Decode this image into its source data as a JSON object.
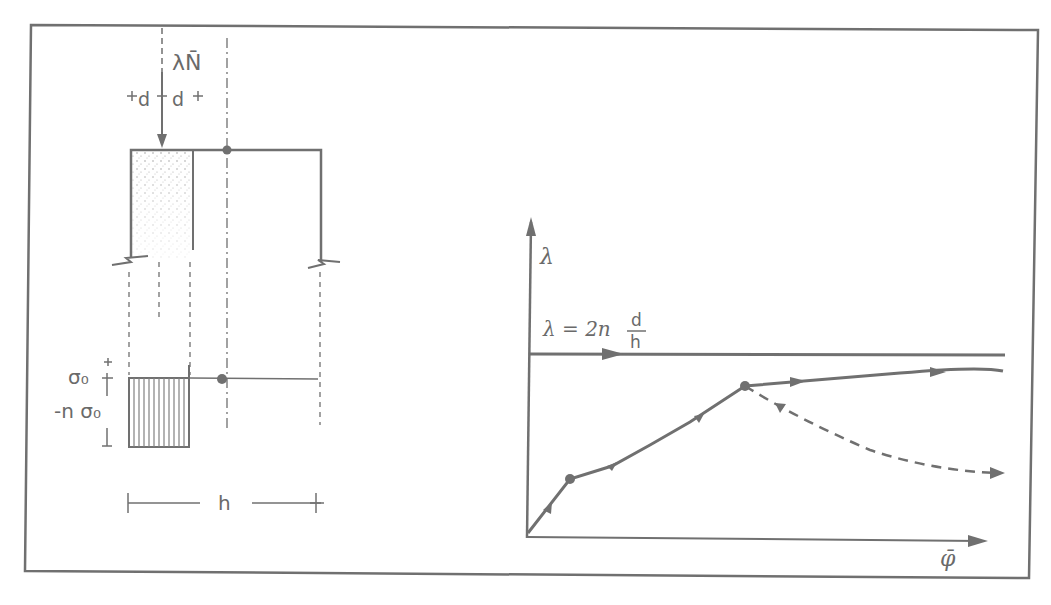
{
  "section": {
    "load_label": "λN̄",
    "d_left": "d",
    "d_right": "d",
    "sigma_top": "σ₀",
    "sigma_bottom": "-n σ₀",
    "width_label": "h"
  },
  "graph": {
    "y_axis_label": "λ",
    "x_axis_label": "φ̄",
    "limit_line_label_prefix": "λ = 2n",
    "limit_fraction_num": "d",
    "limit_fraction_den": "h"
  },
  "colors": {
    "ink": "#707070",
    "background": "#ffffff"
  }
}
